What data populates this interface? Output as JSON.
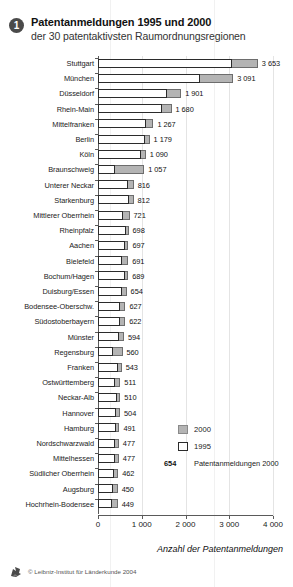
{
  "header": {
    "badge": "1",
    "title": "Patentanmeldungen 1995 und 2000",
    "subtitle": "der 30 patentaktivsten Raumordnungsregionen"
  },
  "legend": {
    "items": [
      {
        "label": "2000",
        "swatch": "filled-gray"
      },
      {
        "label": "1995",
        "swatch": "outline-white"
      }
    ],
    "sample_value": "654",
    "sample_label": "Patentanmeldungen 2000"
  },
  "footer": {
    "credit": "© Leibniz-Institut für Länderkunde 2004",
    "logo": "leibniz-logo-icon"
  },
  "colors": {
    "bar_2000": "#b4b4b4",
    "bar_2000_edge": "#6d6d6d",
    "bar_1995": "#ffffff",
    "bar_1995_edge": "#2b2b2b",
    "axis": "#5a5a5a",
    "grid": "#e4e4e4",
    "badge": "#4a4a4a"
  },
  "chart_data": {
    "type": "bar",
    "orientation": "horizontal",
    "title": "Patentanmeldungen 1995 und 2000",
    "subtitle": "der 30 patentaktivsten Raumordnungsregionen",
    "xlabel": "Anzahl der Patentanmeldungen",
    "ylabel": "",
    "xlim": [
      0,
      4000
    ],
    "xticks": [
      0,
      1000,
      2000,
      3000,
      4000
    ],
    "xtick_labels": [
      "0",
      "1 000",
      "2 000",
      "3 000",
      "4 000"
    ],
    "grid": "vertical",
    "legend_position": "inside-right",
    "categories": [
      "Stuttgart",
      "München",
      "Düsseldorf",
      "Rhein-Main",
      "Mittelfranken",
      "Berlin",
      "Köln",
      "Braunschweig",
      "Unterer Neckar",
      "Starkenburg",
      "Mittlerer Oberrhein",
      "Rheinpfalz",
      "Aachen",
      "Bielefeld",
      "Bochum/Hagen",
      "Duisburg/Essen",
      "Bodensee-Oberschw.",
      "Südostoberbayern",
      "Münster",
      "Regensburg",
      "Franken",
      "Ostwürttemberg",
      "Neckar-Alb",
      "Hannover",
      "Hamburg",
      "Nordschwarzwald",
      "Mittelhessen",
      "Südlicher Oberrhein",
      "Augsburg",
      "Hochrhein-Bodensee"
    ],
    "series": [
      {
        "name": "2000",
        "values": [
          3653,
          3091,
          1901,
          1680,
          1267,
          1179,
          1090,
          1057,
          816,
          812,
          721,
          698,
          697,
          691,
          689,
          654,
          627,
          622,
          594,
          560,
          543,
          511,
          510,
          504,
          491,
          477,
          477,
          462,
          450,
          449
        ]
      },
      {
        "name": "1995",
        "values": [
          3055,
          2330,
          1580,
          1455,
          1090,
          1085,
          990,
          382,
          690,
          700,
          575,
          635,
          620,
          558,
          628,
          540,
          500,
          505,
          480,
          352,
          455,
          395,
          435,
          420,
          410,
          380,
          395,
          375,
          352,
          330
        ]
      }
    ],
    "value_labels": [
      "3 653",
      "3 091",
      "1 901",
      "1 680",
      "1 267",
      "1 179",
      "1 090",
      "1 057",
      "816",
      "812",
      "721",
      "698",
      "697",
      "691",
      "689",
      "654",
      "627",
      "622",
      "594",
      "560",
      "543",
      "511",
      "510",
      "504",
      "491",
      "477",
      "477",
      "462",
      "450",
      "449"
    ]
  }
}
